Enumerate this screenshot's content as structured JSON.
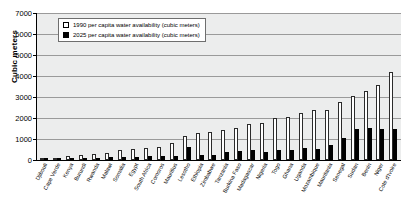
{
  "chart_data": {
    "type": "bar",
    "title": "",
    "subtitle": "",
    "xlabel": "",
    "ylabel": "Cubic meters",
    "ylim": [
      0,
      7000
    ],
    "ytick_step": 1000,
    "yticks": [
      0,
      1000,
      2000,
      3000,
      4000,
      5000,
      6000,
      7000
    ],
    "grid": true,
    "legend_position": "top-left-inside",
    "categories": [
      "Djibouti",
      "Cape Verde",
      "Kenya",
      "Burundi",
      "Rwanda",
      "Malawi",
      "Somalia",
      "Egypt",
      "South Africa",
      "Comoros",
      "Mauritius",
      "Lesotho",
      "Ethiopia",
      "Zimbabwe",
      "Tanzania",
      "Burkina Faso",
      "Madagascar",
      "Nigeria",
      "Togo",
      "Ghana",
      "Uganda",
      "Mozambique",
      "Mauritania",
      "Senegal",
      "Sudan",
      "Benin",
      "Niger",
      "Cote d'Ivoire"
    ],
    "series": [
      {
        "name": "1990 per capita water availability (cubic meters)",
        "color": "#ffffff",
        "values": [
          60,
          110,
          180,
          230,
          290,
          340,
          460,
          510,
          570,
          620,
          800,
          1130,
          1310,
          1330,
          1430,
          1510,
          1700,
          1760,
          2010,
          2060,
          2240,
          2380,
          2390,
          2770,
          3070,
          3310,
          3560,
          4170
        ]
      },
      {
        "name": "2025 per capita water availability (cubic meters)",
        "color": "#000000",
        "values": [
          30,
          40,
          80,
          70,
          100,
          120,
          130,
          150,
          170,
          180,
          210,
          620,
          250,
          230,
          390,
          450,
          480,
          400,
          500,
          470,
          560,
          520,
          700,
          1070,
          1480,
          1530,
          1480,
          1480
        ]
      }
    ],
    "legend": [
      "1990 per capita water availability (cubic meters)",
      "2025 per capita water availability (cubic meters)"
    ]
  },
  "axis": {
    "y_title": "Cubic meters",
    "y_tick_labels": [
      "7000",
      "6000",
      "5000",
      "4000",
      "3000",
      "2000",
      "1000",
      "0"
    ]
  }
}
